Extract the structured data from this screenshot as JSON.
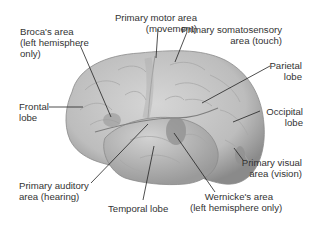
{
  "diagram": {
    "colors": {
      "brain_light": "#d8d8d8",
      "brain_mid": "#b9b9b9",
      "brain_dark": "#8f8f8f",
      "region_highlight": "#9e9e9e",
      "leader_line": "#222222",
      "text": "#333333"
    },
    "labels": {
      "brocas_area": [
        "Broca's area",
        "(left hemisphere",
        "only)"
      ],
      "primary_motor": [
        "Primary motor area",
        "(movement)"
      ],
      "primary_somatosensory": [
        "Primary somatosensory",
        "area (touch)"
      ],
      "parietal_lobe": [
        "Parietal",
        "lobe"
      ],
      "frontal_lobe": [
        "Frontal",
        "lobe"
      ],
      "occipital_lobe": [
        "Occipital",
        "lobe"
      ],
      "primary_visual": [
        "Primary visual",
        "area (vision)"
      ],
      "primary_auditory": [
        "Primary auditory",
        "area (hearing)"
      ],
      "temporal_lobe": [
        "Temporal lobe"
      ],
      "wernickes_area": [
        "Wernicke's area",
        "(left hemisphere only)"
      ]
    }
  }
}
